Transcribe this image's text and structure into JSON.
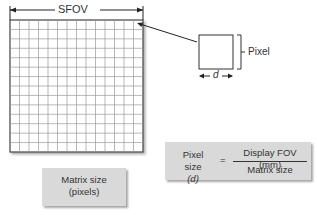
{
  "diagram": {
    "sfov_label": "SFOV",
    "pixel_label": "Pixel",
    "pixel_dimension_label": "d",
    "grid": {
      "rows": 14,
      "columns": 14
    },
    "matrix_box": {
      "line1": "Matrix size",
      "line2": "(pixels)"
    },
    "formula_box": {
      "lhs_line1": "Pixel size",
      "lhs_line2": "(d)",
      "equals": "=",
      "numerator": "Display FOV (mm)",
      "denominator": "Matrix size"
    },
    "colors": {
      "grid_line": "#9a9a9a",
      "border": "#444444",
      "box_fill": "#d9d9d9"
    }
  }
}
